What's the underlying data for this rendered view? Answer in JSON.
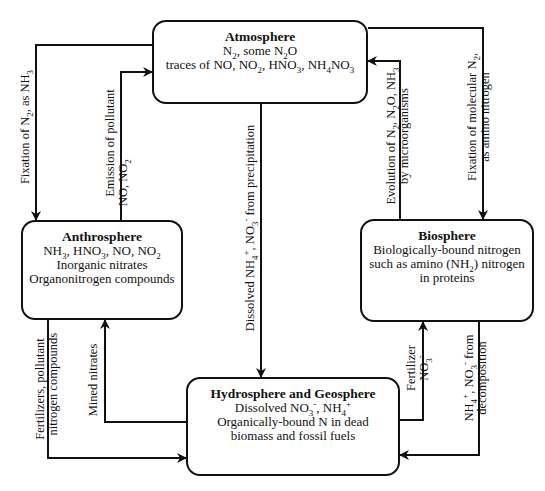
{
  "boxes": {
    "atmosphere": {
      "title": "Atmosphere",
      "line1_html": "N<sub>2</sub>, some N<sub>2</sub>O",
      "line2_html": "traces of NO, NO<sub>2</sub>, HNO<sub>3</sub>, NH<sub>4</sub>NO<sub>3</sub>"
    },
    "anthrosphere": {
      "title": "Anthrosphere",
      "line1_html": "NH<sub>3</sub>, HNO<sub>3</sub>, NO, NO<sub>2</sub>",
      "line2": "Inorganic nitrates",
      "line3": "Organonitrogen compounds"
    },
    "biosphere": {
      "title": "Biosphere",
      "line1": "Biologically-bound nitrogen",
      "line2_html": "such as amino (NH<sub>2</sub>) nitrogen",
      "line3": "in proteins"
    },
    "hydrosphere": {
      "title": "Hydrosphere and Geosphere",
      "line1_html": "Dissolved NO<sub>3</sub><sup>-</sup>, NH<sub>4</sub><sup>+</sup>",
      "line2": "Organically-bound N in dead",
      "line3": "biomass and fossil fuels"
    }
  },
  "arrows": {
    "fixation_nh3": {
      "line1_html": "Fixation of N<sub>2</sub>, as NH<sub>3</sub>"
    },
    "emission_pollutant": {
      "line1": "Emission of pollutant",
      "line2_html": "NO, NO<sub>2</sub>"
    },
    "dissolved_precip": {
      "line1_html": "Dissolved NH<sub>4</sub><sup>+</sup>, NO<sub>3</sub><sup>-</sup> from precipitation"
    },
    "evolution": {
      "line1_html": "Evolution of N<sub>2</sub>, N<sub>2</sub>O, NH<sub>3</sub>",
      "line2": "by microorganisms"
    },
    "fixation_molecular": {
      "line1_html": "Fixation of molecular N<sub>2</sub>,",
      "line2": "as amino nitrogen"
    },
    "fertilizers_pollutant": {
      "line1": "Fertilizers, pollutant",
      "line2": "nitrogen compounds"
    },
    "mined_nitrates": {
      "line1": "Mined nitrates"
    },
    "fertilizer_no3": {
      "line1": "Fertilizer",
      "line2_html": "NO<sub>3</sub><sup>-</sup>"
    },
    "decomposition": {
      "line1_html": "NH<sub>4</sub><sup>+</sup>, NO<sub>3</sub><sup>-</sup> from",
      "line2": "decomposition"
    }
  },
  "colors": {
    "stroke": "#111111",
    "background": "#ffffff"
  }
}
